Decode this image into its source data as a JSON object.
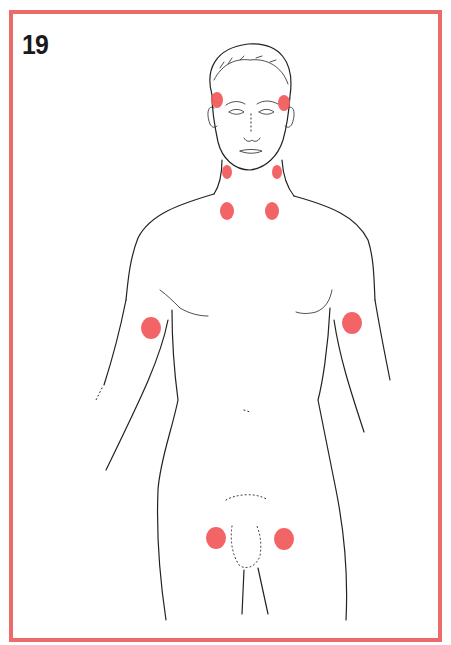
{
  "card": {
    "number": "19",
    "border_color": "#ec6a6a"
  },
  "figure": {
    "marker_color": "#f2575a",
    "markers": [
      {
        "name": "temple-left",
        "cx": 217,
        "cy": 100,
        "rx": 6,
        "ry": 8
      },
      {
        "name": "temple-right",
        "cx": 284,
        "cy": 103,
        "rx": 6,
        "ry": 8
      },
      {
        "name": "jaw-left",
        "cx": 227,
        "cy": 172,
        "rx": 5,
        "ry": 7
      },
      {
        "name": "jaw-right",
        "cx": 277,
        "cy": 172,
        "rx": 5,
        "ry": 7
      },
      {
        "name": "collarbone-left",
        "cx": 227,
        "cy": 211,
        "rx": 7,
        "ry": 9
      },
      {
        "name": "collarbone-right",
        "cx": 272,
        "cy": 211,
        "rx": 7,
        "ry": 9
      },
      {
        "name": "upper-arm-left",
        "cx": 151,
        "cy": 328,
        "rx": 10,
        "ry": 11
      },
      {
        "name": "upper-arm-right",
        "cx": 352,
        "cy": 323,
        "rx": 10,
        "ry": 11
      },
      {
        "name": "groin-left",
        "cx": 216,
        "cy": 538,
        "rx": 10,
        "ry": 11
      },
      {
        "name": "groin-right",
        "cx": 284,
        "cy": 539,
        "rx": 10,
        "ry": 11
      }
    ]
  }
}
